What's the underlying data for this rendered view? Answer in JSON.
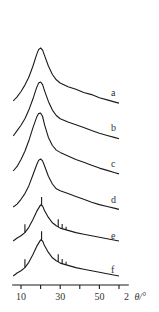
{
  "chart_data": {
    "type": "line",
    "title": "",
    "xlabel": "2 θ/°",
    "xlabel_parts": {
      "prefix": "2",
      "symbol": "θ/°"
    },
    "ylabel": "",
    "xlim": [
      5.5,
      65
    ],
    "x_ticks": [
      10,
      20,
      30,
      40,
      50,
      60
    ],
    "x_tick_labels": [
      {
        "value": 10,
        "label": "10"
      },
      {
        "value": 30,
        "label": "30"
      },
      {
        "value": 50,
        "label": "50"
      }
    ],
    "grid": false,
    "layout": "stacked-offset",
    "series": [
      {
        "name": "a",
        "label": "a",
        "x": [
          6,
          8,
          10,
          12,
          14,
          16,
          18,
          19,
          20,
          21,
          22,
          24,
          26,
          28,
          30,
          34,
          38,
          42,
          46,
          50,
          54,
          58,
          60
        ],
        "y": [
          0.0,
          0.08,
          0.18,
          0.3,
          0.45,
          0.65,
          0.88,
          0.97,
          1.0,
          0.96,
          0.86,
          0.66,
          0.5,
          0.4,
          0.34,
          0.27,
          0.22,
          0.16,
          0.12,
          0.06,
          0.02,
          -0.02,
          -0.04
        ],
        "spikes": []
      },
      {
        "name": "b",
        "label": "b",
        "x": [
          6,
          8,
          10,
          12,
          14,
          16,
          18,
          19,
          20,
          21,
          22,
          24,
          26,
          28,
          30,
          34,
          38,
          42,
          46,
          50,
          54,
          58,
          60
        ],
        "y": [
          0.0,
          0.1,
          0.2,
          0.32,
          0.48,
          0.68,
          0.9,
          0.98,
          1.0,
          0.95,
          0.84,
          0.64,
          0.48,
          0.38,
          0.32,
          0.26,
          0.21,
          0.16,
          0.1,
          0.05,
          0.01,
          -0.03,
          -0.05
        ],
        "spikes": []
      },
      {
        "name": "c",
        "label": "c",
        "x": [
          6,
          8,
          10,
          12,
          14,
          16,
          18,
          19,
          20,
          21,
          22,
          24,
          26,
          28,
          30,
          34,
          38,
          42,
          46,
          50,
          54,
          58,
          60
        ],
        "y": [
          0.0,
          0.08,
          0.2,
          0.34,
          0.52,
          0.74,
          0.93,
          0.99,
          1.0,
          0.94,
          0.8,
          0.58,
          0.44,
          0.36,
          0.32,
          0.26,
          0.2,
          0.15,
          0.1,
          0.05,
          0.01,
          -0.03,
          -0.05
        ],
        "spikes": []
      },
      {
        "name": "d",
        "label": "d",
        "x": [
          6,
          8,
          10,
          12,
          14,
          16,
          18,
          19,
          20,
          21,
          22,
          24,
          26,
          28,
          30,
          34,
          38,
          42,
          46,
          50,
          54,
          58,
          60
        ],
        "y": [
          0.0,
          0.06,
          0.16,
          0.28,
          0.44,
          0.66,
          0.88,
          0.97,
          1.0,
          0.96,
          0.86,
          0.64,
          0.48,
          0.38,
          0.34,
          0.28,
          0.22,
          0.16,
          0.1,
          0.05,
          0.01,
          -0.03,
          -0.05
        ],
        "spikes": []
      },
      {
        "name": "e",
        "label": "e",
        "x": [
          6,
          8,
          10,
          12,
          14,
          16,
          18,
          20,
          21,
          22,
          24,
          26,
          28,
          30,
          34,
          38,
          42,
          46,
          50,
          54,
          58,
          60
        ],
        "y": [
          0.0,
          0.08,
          0.14,
          0.22,
          0.36,
          0.56,
          0.78,
          0.95,
          0.92,
          0.8,
          0.62,
          0.48,
          0.4,
          0.34,
          0.28,
          0.22,
          0.18,
          0.14,
          0.1,
          0.06,
          0.02,
          0.0
        ],
        "spikes": [
          {
            "x": 12,
            "h": 0.22
          },
          {
            "x": 20.5,
            "h": 0.22
          },
          {
            "x": 29,
            "h": 0.2
          },
          {
            "x": 31,
            "h": 0.12
          },
          {
            "x": 33,
            "h": 0.08
          }
        ]
      },
      {
        "name": "f",
        "label": "f",
        "x": [
          6,
          8,
          10,
          12,
          14,
          16,
          18,
          20,
          21,
          22,
          24,
          26,
          28,
          30,
          34,
          38,
          42,
          46,
          50,
          54,
          58,
          60
        ],
        "y": [
          0.0,
          0.08,
          0.14,
          0.22,
          0.36,
          0.56,
          0.78,
          0.95,
          0.92,
          0.8,
          0.62,
          0.48,
          0.4,
          0.34,
          0.28,
          0.22,
          0.18,
          0.14,
          0.1,
          0.06,
          0.02,
          0.0
        ],
        "spikes": [
          {
            "x": 12,
            "h": 0.22
          },
          {
            "x": 20.5,
            "h": 0.24
          },
          {
            "x": 29,
            "h": 0.2
          },
          {
            "x": 31,
            "h": 0.12
          },
          {
            "x": 33,
            "h": 0.08
          }
        ]
      }
    ]
  }
}
